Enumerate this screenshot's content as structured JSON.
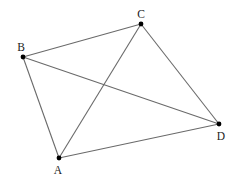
{
  "diagram": {
    "type": "quadrilateral-with-diagonals",
    "points": {
      "A": {
        "label": "A",
        "x": 59,
        "y": 158,
        "label_x": 58,
        "label_y": 174
      },
      "B": {
        "label": "B",
        "x": 23,
        "y": 57,
        "label_x": 21,
        "label_y": 51
      },
      "C": {
        "label": "C",
        "x": 141,
        "y": 24,
        "label_x": 141,
        "label_y": 18
      },
      "D": {
        "label": "D",
        "x": 219,
        "y": 124,
        "label_x": 221,
        "label_y": 140
      }
    },
    "edges": [
      [
        "A",
        "B"
      ],
      [
        "B",
        "C"
      ],
      [
        "C",
        "D"
      ],
      [
        "D",
        "A"
      ],
      [
        "A",
        "C"
      ],
      [
        "B",
        "D"
      ]
    ],
    "colors": {
      "line": "#6a6a6a",
      "point": "#000000",
      "label": "#222222"
    }
  }
}
